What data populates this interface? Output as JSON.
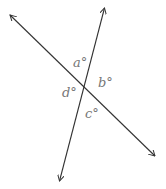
{
  "diagram": {
    "line_color": "#333333",
    "label_color": "#777777",
    "lines": [
      {
        "name": "line-1",
        "from": [
          9,
          14
        ],
        "to": [
          156,
          157
        ]
      },
      {
        "name": "line-2",
        "from": [
          105,
          7
        ],
        "to": [
          59,
          182
        ]
      }
    ],
    "intersection": [
      84,
      88
    ],
    "angles": {
      "a": "a°",
      "b": "b°",
      "c": "c°",
      "d": "d°"
    }
  }
}
